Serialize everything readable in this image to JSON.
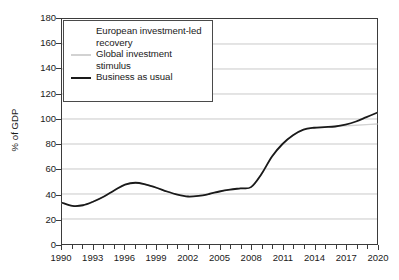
{
  "chart_data": {
    "type": "line",
    "title": "",
    "xlabel": "",
    "ylabel": "% of GDP",
    "xlim": [
      1990,
      2020
    ],
    "ylim": [
      0,
      180
    ],
    "yticks": [
      0,
      20,
      40,
      60,
      80,
      100,
      120,
      140,
      160,
      180
    ],
    "xticks_major": [
      1990,
      1993,
      1996,
      1999,
      2002,
      2005,
      2008,
      2011,
      2014,
      2017,
      2020
    ],
    "xticks_minor_step": 1,
    "grid": "horizontal",
    "legend_position": "top-left-inside",
    "x": [
      1990,
      1991,
      1992,
      1993,
      1994,
      1995,
      1996,
      1997,
      1998,
      1999,
      2000,
      2001,
      2002,
      2003,
      2004,
      2005,
      2006,
      2007,
      2008,
      2009,
      2010,
      2011,
      2012,
      2013,
      2014,
      2015,
      2016,
      2017,
      2018,
      2019,
      2020
    ],
    "series": [
      {
        "name": "European investment-led recovery",
        "color": "#ffffff",
        "width": 1.4,
        "values": [
          33,
          30.5,
          31,
          34,
          38,
          43,
          47.5,
          49,
          47.5,
          45,
          42,
          39.5,
          38,
          38.5,
          40,
          42,
          43.5,
          44.5,
          45.5,
          56,
          70,
          80,
          87,
          91.5,
          93,
          93.5,
          94,
          95.5,
          98,
          101.5,
          105
        ]
      },
      {
        "name": "Global investment stimulus",
        "color": "#d2d2d2",
        "width": 1.4,
        "values": [
          33,
          30.5,
          31,
          34,
          38,
          43,
          47.5,
          49,
          47.5,
          45,
          42,
          39.5,
          38,
          38.5,
          40,
          42,
          43.5,
          44.5,
          45.5,
          56,
          70,
          80,
          87,
          91.5,
          93,
          93.5,
          94,
          94.5,
          95,
          95.5,
          96
        ]
      },
      {
        "name": "Business as usual",
        "color": "#1a1a1a",
        "width": 1.8,
        "values": [
          33,
          30.5,
          31,
          34,
          38,
          43,
          47.5,
          49,
          47.5,
          45,
          42,
          39.5,
          38,
          38.5,
          40,
          42,
          43.5,
          44.5,
          45.5,
          56,
          70,
          80,
          87,
          91.5,
          93,
          93.5,
          94,
          95.5,
          98,
          101.5,
          105
        ]
      }
    ]
  },
  "legend": {
    "entries": [
      {
        "label": "European investment-led recovery",
        "color": "#ffffff"
      },
      {
        "label": "Global investment stimulus",
        "color": "#d2d2d2"
      },
      {
        "label": "Business as usual",
        "color": "#1a1a1a"
      }
    ]
  },
  "axes": {
    "ylabel": "% of GDP",
    "ytick_labels": [
      "180",
      "160",
      "140",
      "120",
      "100",
      "80",
      "60",
      "40",
      "20",
      "0"
    ],
    "xtick_labels": [
      "1990",
      "1993",
      "1996",
      "1999",
      "2002",
      "2005",
      "2008",
      "2011",
      "2014",
      "2017",
      "2020"
    ]
  },
  "colors": {
    "axis": "#3b3b3b",
    "grid": "#c9c9c9",
    "background": "#ffffff",
    "text": "#1a1a1a"
  }
}
